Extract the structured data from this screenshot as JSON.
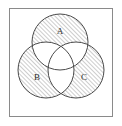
{
  "figure": {
    "kind": "venn-3",
    "frame": {
      "visible": true,
      "stroke_color": "#8a8a8a",
      "stroke_width": 1,
      "x": 9,
      "y": 8,
      "width": 104,
      "height": 109,
      "fill_color": "#ffffff"
    },
    "canvas": {
      "background_color": "#ffffff",
      "width": 122,
      "height": 126
    }
  },
  "style": {
    "circle_stroke_color": "#4a4a4a",
    "circle_stroke_width": 1,
    "hatch_color": "#6e6e6e",
    "hatch_line_width": 0.7,
    "hatch_spacing": 3,
    "hatch_angle_deg": 45,
    "hatch_direction": "lower-left-to-upper-right",
    "unshaded_fill_color": "#ffffff",
    "label_color": "#2b2b2b",
    "label_font_size": 9
  },
  "sets": [
    {
      "id": "A",
      "label": "A",
      "label_x": 60,
      "label_y": 32,
      "center_x": 60,
      "center_y": 42,
      "radius": 28,
      "position": "top",
      "exclusive_region_shaded": true
    },
    {
      "id": "B",
      "label": "B",
      "label_x": 37,
      "label_y": 78,
      "center_x": 46,
      "center_y": 70,
      "radius": 28,
      "position": "bottom-left",
      "exclusive_region_shaded": true
    },
    {
      "id": "C",
      "label": "C",
      "label_x": 84,
      "label_y": 78,
      "center_x": 76,
      "center_y": 70,
      "radius": 28,
      "position": "bottom-right",
      "exclusive_region_shaded": true
    }
  ],
  "regions": [
    {
      "id": "A-only",
      "expression": "A \\ (B ∪ C)",
      "shaded": true
    },
    {
      "id": "B-only",
      "expression": "B \\ (A ∪ C)",
      "shaded": true
    },
    {
      "id": "C-only",
      "expression": "C \\ (A ∪ B)",
      "shaded": true
    },
    {
      "id": "A-and-B",
      "expression": "A ∩ B",
      "shaded": false
    },
    {
      "id": "A-and-C",
      "expression": "A ∩ C",
      "shaded": false
    },
    {
      "id": "B-and-C",
      "expression": "B ∩ C",
      "shaded": false
    },
    {
      "id": "A-B-C",
      "expression": "A ∩ B ∩ C",
      "shaded": false
    },
    {
      "id": "outside",
      "expression": "U \\ (A ∪ B ∪ C)",
      "shaded": false
    }
  ]
}
